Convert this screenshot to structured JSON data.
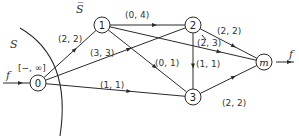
{
  "diagram": {
    "type": "flow-network",
    "set_labels": {
      "source_side": "S",
      "sink_side": "S̅"
    },
    "source_label": "[−, ∞]",
    "flow_in_label": "f",
    "flow_out_label": "f",
    "nodes": [
      {
        "id": "0",
        "label": "0"
      },
      {
        "id": "1",
        "label": "1"
      },
      {
        "id": "2",
        "label": "2"
      },
      {
        "id": "3",
        "label": "3"
      },
      {
        "id": "m",
        "label": "m"
      }
    ],
    "edges": [
      {
        "from": "0",
        "to": "1",
        "label": "(2, 2)"
      },
      {
        "from": "0",
        "to": "2",
        "label": "(3, 3)"
      },
      {
        "from": "0",
        "to": "3",
        "label": "(1, 1)"
      },
      {
        "from": "1",
        "to": "2",
        "label": "(0, 4)"
      },
      {
        "from": "1",
        "to": "3",
        "label": "(0, 1)"
      },
      {
        "from": "1",
        "to": "m",
        "label": "(2, 3)"
      },
      {
        "from": "2",
        "to": "3",
        "label": "(1, 1)"
      },
      {
        "from": "2",
        "to": "m",
        "label": "(2, 2)"
      },
      {
        "from": "3",
        "to": "m",
        "label": "(2, 2)"
      }
    ]
  }
}
